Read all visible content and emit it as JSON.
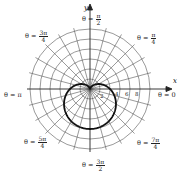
{
  "chart_data": {
    "type": "line",
    "subtype": "polar",
    "title": "",
    "curve": {
      "name": "cardioid",
      "equation": "r = 4 - 4 sin(theta)",
      "a": 4,
      "color": "#111111"
    },
    "grid": {
      "rings": [
        2,
        4,
        6,
        8,
        10,
        12
      ],
      "spoke_step_deg": 15
    },
    "axes": {
      "x_label": "x",
      "y_label": "y"
    },
    "radial_tick_labels": [
      "2",
      "4",
      "6",
      "8"
    ],
    "angle_labels": [
      {
        "key": "east",
        "text": "θ = 0"
      },
      {
        "key": "ne",
        "prefix": "θ = ",
        "num": "π",
        "den": "4"
      },
      {
        "key": "north",
        "prefix": "θ = ",
        "num": "π",
        "den": "2"
      },
      {
        "key": "nw",
        "prefix": "θ = ",
        "num": "3π",
        "den": "4"
      },
      {
        "key": "west",
        "text": "θ = π"
      },
      {
        "key": "sw",
        "prefix": "θ = ",
        "num": "5π",
        "den": "4"
      },
      {
        "key": "south",
        "prefix": "θ = ",
        "num": "3π",
        "den": "2"
      },
      {
        "key": "se",
        "prefix": "θ = ",
        "num": "7π",
        "den": "4"
      }
    ]
  }
}
